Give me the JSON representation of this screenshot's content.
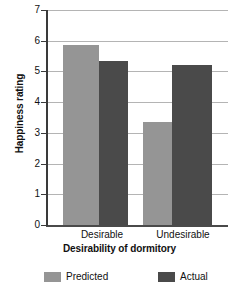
{
  "chart_data": {
    "type": "bar",
    "title": "",
    "categories": [
      "Desirable",
      "Undesirable"
    ],
    "series": [
      {
        "name": "Predicted",
        "values": [
          5.85,
          3.35
        ],
        "color": "#959595"
      },
      {
        "name": "Actual",
        "values": [
          5.35,
          5.2
        ],
        "color": "#4a4a4a"
      }
    ],
    "xlabel": "Desirability of dormitory",
    "ylabel": "Happiness rating",
    "ylim": [
      0,
      7
    ],
    "yticks": [
      0,
      1,
      2,
      3,
      4,
      5,
      6,
      7
    ],
    "ytick_labels": [
      "0",
      "1",
      "2",
      "3",
      "4",
      "5",
      "6",
      "7"
    ],
    "grid": true,
    "legend_position": "bottom"
  },
  "axes": {
    "y_title": "Happiness rating",
    "x_title": "Desirability of dormitory",
    "y_ticks": [
      {
        "label": "7",
        "value": 7
      },
      {
        "label": "6",
        "value": 6
      },
      {
        "label": "5",
        "value": 5
      },
      {
        "label": "4",
        "value": 4
      },
      {
        "label": "3",
        "value": 3
      },
      {
        "label": "2",
        "value": 2
      },
      {
        "label": "1",
        "value": 1
      },
      {
        "label": "0",
        "value": 0
      }
    ],
    "x_groups": [
      {
        "label": "Desirable"
      },
      {
        "label": "Undesirable"
      }
    ]
  },
  "legend": {
    "items": [
      {
        "label": "Predicted",
        "color": "#959595"
      },
      {
        "label": "Actual",
        "color": "#4a4a4a"
      }
    ]
  },
  "colors": {
    "predicted": "#959595",
    "actual": "#4a4a4a",
    "gridline": "#b4b4b4",
    "axis": "#3a3a3a",
    "background": "#ffffff"
  }
}
